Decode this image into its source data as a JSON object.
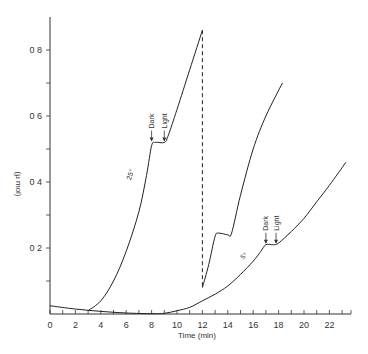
{
  "chart_data": {
    "type": "line",
    "title": "",
    "xlabel": "Time (min)",
    "ylabel": "(µ mol)",
    "xlim": [
      0,
      23.7
    ],
    "ylim": [
      0,
      0.9
    ],
    "grid": false,
    "legend": null,
    "x_ticks": [
      0,
      2,
      4,
      6,
      8,
      10,
      12,
      14,
      16,
      18,
      20,
      22
    ],
    "x_tick_labels": [
      "0",
      "2",
      "4",
      "6",
      "8",
      "10",
      "12",
      "14",
      "16",
      "18",
      "20",
      "22"
    ],
    "x_minor_ticks": [
      1,
      3,
      5,
      7,
      9,
      11,
      13,
      15,
      17,
      19,
      21,
      23
    ],
    "y_ticks": [
      0.2,
      0.4,
      0.6,
      0.8
    ],
    "y_tick_labels": [
      "0 2",
      "0 4",
      "0 6",
      "0 8"
    ],
    "y_minor_ticks": [
      0.1,
      0.3,
      0.5,
      0.7
    ],
    "series": [
      {
        "name": "25°",
        "style": "solid",
        "x": [
          3,
          4,
          5,
          6,
          7,
          7.6,
          8.0,
          8.3,
          9.0,
          9.3,
          10,
          11,
          12
        ],
        "y": [
          0.01,
          0.04,
          0.1,
          0.19,
          0.31,
          0.42,
          0.51,
          0.52,
          0.52,
          0.54,
          0.62,
          0.74,
          0.86
        ]
      },
      {
        "name": "transfer (dashed)",
        "style": "dashed",
        "x": [
          12,
          12
        ],
        "y": [
          0.86,
          0.08
        ]
      },
      {
        "name": "after transfer",
        "style": "solid",
        "x": [
          12,
          12.5,
          13,
          13.3,
          14,
          14.3,
          15,
          16,
          17,
          18.3
        ],
        "y": [
          0.08,
          0.15,
          0.235,
          0.245,
          0.24,
          0.245,
          0.36,
          0.5,
          0.6,
          0.7
        ]
      },
      {
        "name": "5°",
        "style": "solid",
        "x": [
          0,
          2,
          4,
          6,
          8,
          9,
          10,
          11,
          12,
          13,
          14,
          15,
          16,
          16.6,
          17,
          17.6,
          18,
          19,
          20,
          21,
          22,
          23.3
        ],
        "y": [
          0.025,
          0.015,
          0.008,
          0.003,
          0.001,
          0.002,
          0.01,
          0.02,
          0.04,
          0.06,
          0.085,
          0.12,
          0.16,
          0.19,
          0.21,
          0.21,
          0.215,
          0.25,
          0.29,
          0.34,
          0.39,
          0.46
        ]
      }
    ],
    "annotations": [
      {
        "text": "25°",
        "x": 6.5,
        "y": 0.42,
        "rotation": -70
      },
      {
        "text": "5°",
        "x": 15.4,
        "y": 0.17,
        "rotation": -40
      },
      {
        "text": "Dark",
        "x": 8.0,
        "y": 0.55,
        "arrow": "down",
        "rotation": -90
      },
      {
        "text": "Light",
        "x": 9.0,
        "y": 0.55,
        "arrow": "down",
        "rotation": -90
      },
      {
        "text": "Dark",
        "x": 17.0,
        "y": 0.24,
        "arrow": "down",
        "rotation": -90
      },
      {
        "text": "Light",
        "x": 17.8,
        "y": 0.24,
        "arrow": "down",
        "rotation": -90
      }
    ]
  },
  "labels": {
    "xlabel": "Time (min)",
    "ylabel": "(µ mol)",
    "origin": "0",
    "curve_25": "25°",
    "curve_5": "5°",
    "dark": "Dark",
    "light": "Light"
  }
}
